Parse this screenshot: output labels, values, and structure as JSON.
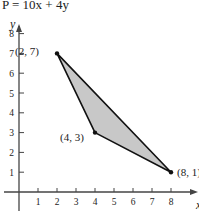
{
  "chart_data": {
    "type": "scatter",
    "title": "P = 10x + 4y",
    "xlabel": "x",
    "ylabel": "y",
    "xlim": [
      0,
      8.5
    ],
    "ylim": [
      0,
      8.5
    ],
    "x_ticks": [
      1,
      2,
      3,
      4,
      5,
      6,
      7,
      8
    ],
    "y_ticks": [
      1,
      2,
      3,
      4,
      5,
      6,
      7,
      8
    ],
    "grid": false,
    "polygon": {
      "vertices": [
        [
          2,
          7
        ],
        [
          4,
          3
        ],
        [
          8,
          1
        ]
      ],
      "fill": "#c8c8c8",
      "stroke": "#111111"
    },
    "points": [
      {
        "x": 2,
        "y": 7,
        "label": "(2, 7)"
      },
      {
        "x": 4,
        "y": 3,
        "label": "(4, 3)"
      },
      {
        "x": 8,
        "y": 1,
        "label": "(8, 1)"
      }
    ]
  },
  "colors": {
    "axis": "#444444",
    "fill": "#c8c8c8",
    "stroke": "#111111",
    "text": "#222222"
  }
}
